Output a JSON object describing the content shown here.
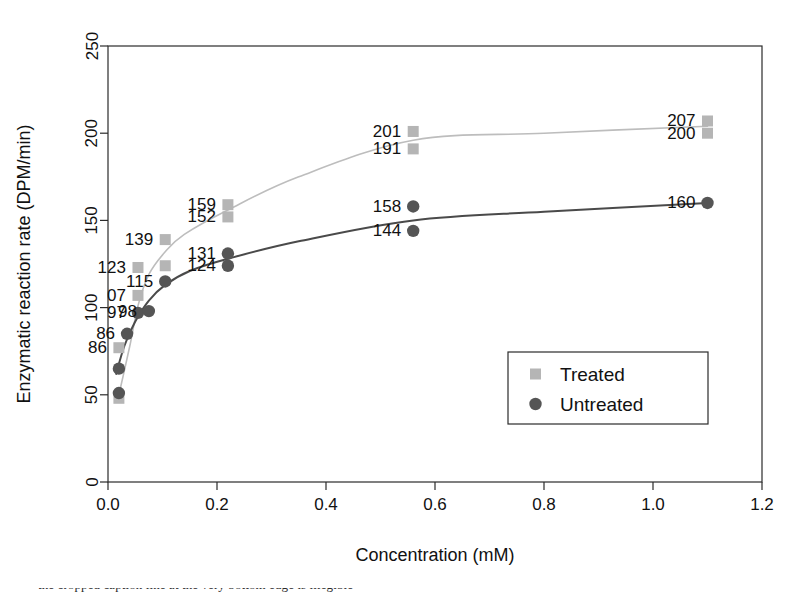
{
  "chart_data": {
    "type": "scatter",
    "title": "",
    "xlabel": "Concentration (mM)",
    "ylabel": "Enzymatic reaction rate (DPM/min)",
    "xlim": [
      0.0,
      1.2
    ],
    "ylim": [
      0,
      250
    ],
    "xticks": [
      "0.0",
      "0.2",
      "0.4",
      "0.6",
      "0.8",
      "1.0",
      "1.2"
    ],
    "yticks": [
      "0",
      "50",
      "100",
      "150",
      "200",
      "250"
    ],
    "xtick_values": [
      0.0,
      0.2,
      0.4,
      0.6,
      0.8,
      1.0,
      1.2
    ],
    "ytick_values": [
      0,
      50,
      100,
      150,
      200,
      250
    ],
    "grid": false,
    "legend_position": "bottom-right",
    "legend": [
      "Treated",
      "Untreated"
    ],
    "series": [
      {
        "name": "Treated",
        "marker": "square",
        "color": "#b5b5b5",
        "line_color": "#bdbdbd",
        "points": [
          {
            "x": 0.02,
            "y": 48,
            "label": ""
          },
          {
            "x": 0.02,
            "y": 77,
            "label": "86"
          },
          {
            "x": 0.055,
            "y": 107,
            "label": "07"
          },
          {
            "x": 0.055,
            "y": 123,
            "label": "123"
          },
          {
            "x": 0.105,
            "y": 139,
            "label": "139"
          },
          {
            "x": 0.105,
            "y": 124,
            "label": ""
          },
          {
            "x": 0.22,
            "y": 159,
            "label": "159"
          },
          {
            "x": 0.22,
            "y": 152,
            "label": "152"
          },
          {
            "x": 0.56,
            "y": 201,
            "label": "201"
          },
          {
            "x": 0.56,
            "y": 191,
            "label": "191"
          },
          {
            "x": 1.1,
            "y": 207,
            "label": "207"
          },
          {
            "x": 1.1,
            "y": 200,
            "label": "200"
          }
        ],
        "fit_curve": [
          {
            "x": 0.02,
            "y": 50
          },
          {
            "x": 0.04,
            "y": 78
          },
          {
            "x": 0.055,
            "y": 101
          },
          {
            "x": 0.075,
            "y": 119
          },
          {
            "x": 0.105,
            "y": 132
          },
          {
            "x": 0.14,
            "y": 142
          },
          {
            "x": 0.22,
            "y": 156
          },
          {
            "x": 0.35,
            "y": 175
          },
          {
            "x": 0.56,
            "y": 196
          },
          {
            "x": 0.8,
            "y": 200
          },
          {
            "x": 1.1,
            "y": 204
          }
        ]
      },
      {
        "name": "Untreated",
        "marker": "circle",
        "color": "#555555",
        "line_color": "#4a4a4a",
        "points": [
          {
            "x": 0.02,
            "y": 51,
            "label": ""
          },
          {
            "x": 0.02,
            "y": 65,
            "label": ""
          },
          {
            "x": 0.035,
            "y": 85,
            "label": "86"
          },
          {
            "x": 0.055,
            "y": 97,
            "label": "97"
          },
          {
            "x": 0.075,
            "y": 98,
            "label": "98"
          },
          {
            "x": 0.105,
            "y": 115,
            "label": "115"
          },
          {
            "x": 0.22,
            "y": 131,
            "label": "131"
          },
          {
            "x": 0.22,
            "y": 124,
            "label": "124"
          },
          {
            "x": 0.56,
            "y": 158,
            "label": "158"
          },
          {
            "x": 0.56,
            "y": 144,
            "label": "144"
          },
          {
            "x": 1.1,
            "y": 160,
            "label": "160"
          }
        ],
        "fit_curve": [
          {
            "x": 0.015,
            "y": 62
          },
          {
            "x": 0.03,
            "y": 78
          },
          {
            "x": 0.05,
            "y": 92
          },
          {
            "x": 0.075,
            "y": 104
          },
          {
            "x": 0.105,
            "y": 113
          },
          {
            "x": 0.15,
            "y": 121
          },
          {
            "x": 0.22,
            "y": 128
          },
          {
            "x": 0.35,
            "y": 138
          },
          {
            "x": 0.56,
            "y": 150
          },
          {
            "x": 0.8,
            "y": 155
          },
          {
            "x": 1.1,
            "y": 160
          }
        ]
      }
    ]
  },
  "axes": {
    "xlabel": "Concentration (mM)",
    "ylabel": "Enzymatic reaction rate (DPM/min)"
  },
  "legend": {
    "items": [
      {
        "label": "Treated",
        "marker": "square",
        "color": "#b5b5b5"
      },
      {
        "label": "Untreated",
        "marker": "circle",
        "color": "#555555"
      }
    ]
  },
  "footer": {
    "clipped_caption": "the cropped caption line at the very bottom edge is illegible"
  }
}
